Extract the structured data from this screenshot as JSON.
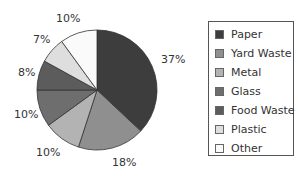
{
  "chart_data": {
    "type": "pie",
    "title": "",
    "categories": [
      "Paper",
      "Yard Waste",
      "Metal",
      "Glass",
      "Food Waste",
      "Plastic",
      "Other"
    ],
    "values": [
      37,
      18,
      10,
      10,
      8,
      7,
      10
    ],
    "labels": [
      "37%",
      "18%",
      "10%",
      "10%",
      "8%",
      "7%",
      "10%"
    ],
    "colors": [
      "#3d3d3d",
      "#8f8f8f",
      "#b3b3b3",
      "#6e6e6e",
      "#5c5c5c",
      "#dedede",
      "#fafafa"
    ],
    "start_angle_deg": 0,
    "direction": "clockwise",
    "legend_position": "right"
  },
  "legend": {
    "items": [
      {
        "label": "Paper",
        "color": "#3d3d3d"
      },
      {
        "label": "Yard Waste",
        "color": "#8f8f8f"
      },
      {
        "label": "Metal",
        "color": "#b3b3b3"
      },
      {
        "label": "Glass",
        "color": "#6e6e6e"
      },
      {
        "label": "Food Waste",
        "color": "#5c5c5c"
      },
      {
        "label": "Plastic",
        "color": "#dedede"
      },
      {
        "label": "Other",
        "color": "#fafafa"
      }
    ]
  },
  "slice_labels": [
    {
      "text": "37%",
      "x": 161,
      "y": 53
    },
    {
      "text": "18%",
      "x": 112,
      "y": 156
    },
    {
      "text": "10%",
      "x": 36,
      "y": 146
    },
    {
      "text": "10%",
      "x": 14,
      "y": 108
    },
    {
      "text": "8%",
      "x": 18,
      "y": 66
    },
    {
      "text": "7%",
      "x": 33,
      "y": 33
    },
    {
      "text": "10%",
      "x": 56,
      "y": 12
    }
  ]
}
